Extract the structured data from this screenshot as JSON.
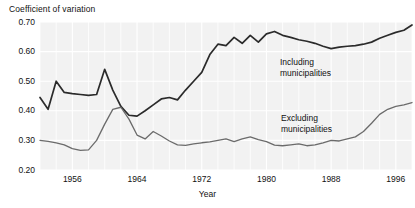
{
  "chart_data": {
    "type": "line",
    "title": "",
    "ylabel": "Coefficient of variation",
    "xlabel": "Year",
    "ylim": [
      0.2,
      0.7
    ],
    "xlim": [
      1952,
      1998
    ],
    "grid": "both",
    "legend_position": "inline-annotation",
    "ytick_labels": [
      "0.70",
      "0.60",
      "0.50",
      "0.40",
      "0.30",
      "0.20"
    ],
    "ytick_values": [
      0.7,
      0.6,
      0.5,
      0.4,
      0.3,
      0.2
    ],
    "xtick_labels": [
      "1956",
      "1964",
      "1972",
      "1980",
      "1988",
      "1996"
    ],
    "xtick_values": [
      1956,
      1964,
      1972,
      1980,
      1988,
      1996
    ],
    "x": [
      1952,
      1953,
      1954,
      1955,
      1956,
      1957,
      1958,
      1959,
      1960,
      1961,
      1962,
      1963,
      1964,
      1965,
      1966,
      1967,
      1968,
      1969,
      1970,
      1971,
      1972,
      1973,
      1974,
      1975,
      1976,
      1977,
      1978,
      1979,
      1980,
      1981,
      1982,
      1983,
      1984,
      1985,
      1986,
      1987,
      1988,
      1989,
      1990,
      1991,
      1992,
      1993,
      1994,
      1995,
      1996,
      1997,
      1998
    ],
    "series": [
      {
        "name": "Including municipalities",
        "color": "#2b2b2b",
        "values": [
          0.445,
          0.405,
          0.5,
          0.462,
          0.458,
          0.455,
          0.452,
          0.455,
          0.54,
          0.47,
          0.415,
          0.385,
          0.382,
          0.4,
          0.42,
          0.44,
          0.445,
          0.437,
          0.47,
          0.5,
          0.53,
          0.59,
          0.625,
          0.62,
          0.648,
          0.628,
          0.655,
          0.632,
          0.66,
          0.668,
          0.655,
          0.648,
          0.64,
          0.635,
          0.628,
          0.618,
          0.61,
          0.615,
          0.618,
          0.62,
          0.625,
          0.632,
          0.645,
          0.655,
          0.665,
          0.672,
          0.69
        ]
      },
      {
        "name": "Excluding municipalities",
        "color": "#6b6b6b",
        "values": [
          0.3,
          0.297,
          0.292,
          0.285,
          0.272,
          0.266,
          0.268,
          0.3,
          0.355,
          0.405,
          0.412,
          0.372,
          0.318,
          0.305,
          0.33,
          0.315,
          0.298,
          0.285,
          0.283,
          0.288,
          0.292,
          0.295,
          0.3,
          0.305,
          0.296,
          0.305,
          0.312,
          0.303,
          0.296,
          0.284,
          0.282,
          0.285,
          0.288,
          0.282,
          0.285,
          0.292,
          0.3,
          0.298,
          0.305,
          0.312,
          0.33,
          0.358,
          0.388,
          0.405,
          0.415,
          0.42,
          0.428
        ]
      }
    ],
    "annotations": [
      {
        "text_line1": "Including",
        "text_line2": "municipalities",
        "series": "Including municipalities"
      },
      {
        "text_line1": "Excluding",
        "text_line2": "municipalities",
        "series": "Excluding municipalities"
      }
    ]
  },
  "style": {
    "plot_background": "#f2f2f2",
    "gridline_color": "#ffffff",
    "page_background": "#ffffff",
    "text_color": "#111111"
  },
  "legend": {
    "including_l1": "Including",
    "including_l2": "municipalities",
    "excluding_l1": "Excluding",
    "excluding_l2": "municipalities"
  }
}
